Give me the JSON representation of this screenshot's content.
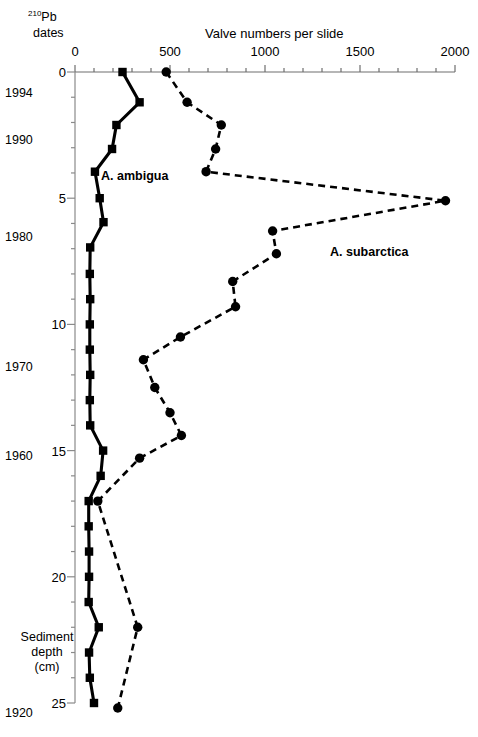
{
  "figure": {
    "left_header_line1_sup": "210",
    "left_header_line1": "Pb",
    "left_header_line2": "dates",
    "axis_title": "Valve numbers per slide",
    "depth_caption_line1": "Sediment",
    "depth_caption_line2": "depth",
    "depth_caption_line3": "(cm)"
  },
  "chart_data": {
    "type": "line",
    "title": "Valve numbers per slide",
    "xlabel": "Valve numbers per slide",
    "ylabel": "Sediment depth (cm)",
    "xlim": [
      0,
      2000
    ],
    "ylim": [
      0,
      25
    ],
    "y_inverted": true,
    "grid": false,
    "legend": "inline-annotations",
    "x_ticks": [
      0,
      500,
      1000,
      1500,
      2000
    ],
    "x_tick_labels": [
      "0",
      "500",
      "1000",
      "1500",
      "2000"
    ],
    "x_minor_tick_step": 100,
    "y_ticks": [
      0,
      5,
      10,
      15,
      20,
      25
    ],
    "y_tick_labels": [
      "0",
      "5",
      "10",
      "15",
      "20",
      "25"
    ],
    "y_minor_tick_step": 1,
    "secondary_axis": {
      "name": "210-Pb dates",
      "entries": [
        {
          "label": "1994",
          "depth": 0.85
        },
        {
          "label": "1990",
          "depth": 2.7
        },
        {
          "label": "1980",
          "depth": 6.55
        },
        {
          "label": "1970",
          "depth": 11.7
        },
        {
          "label": "1960",
          "depth": 15.2
        },
        {
          "label": "1920",
          "depth": 25.4
        }
      ]
    },
    "series": [
      {
        "name": "A. ambigua",
        "linestyle": "solid",
        "marker": "square",
        "color": "#000000",
        "points": [
          {
            "depth": 0.0,
            "value": 250
          },
          {
            "depth": 1.2,
            "value": 340
          },
          {
            "depth": 2.1,
            "value": 218
          },
          {
            "depth": 3.05,
            "value": 195
          },
          {
            "depth": 3.95,
            "value": 105
          },
          {
            "depth": 5.0,
            "value": 130
          },
          {
            "depth": 5.95,
            "value": 150
          },
          {
            "depth": 6.95,
            "value": 80
          },
          {
            "depth": 8.0,
            "value": 78
          },
          {
            "depth": 9.0,
            "value": 80
          },
          {
            "depth": 10.0,
            "value": 78
          },
          {
            "depth": 11.0,
            "value": 78
          },
          {
            "depth": 12.0,
            "value": 80
          },
          {
            "depth": 13.0,
            "value": 78
          },
          {
            "depth": 14.0,
            "value": 80
          },
          {
            "depth": 15.0,
            "value": 148
          },
          {
            "depth": 16.0,
            "value": 135
          },
          {
            "depth": 17.0,
            "value": 72
          },
          {
            "depth": 18.0,
            "value": 72
          },
          {
            "depth": 19.0,
            "value": 74
          },
          {
            "depth": 20.0,
            "value": 74
          },
          {
            "depth": 21.0,
            "value": 72
          },
          {
            "depth": 22.0,
            "value": 125
          },
          {
            "depth": 23.0,
            "value": 74
          },
          {
            "depth": 24.0,
            "value": 78
          },
          {
            "depth": 25.0,
            "value": 100
          }
        ]
      },
      {
        "name": "A. subarctica",
        "linestyle": "dashed",
        "marker": "circle",
        "color": "#000000",
        "points": [
          {
            "depth": 0.0,
            "value": 480
          },
          {
            "depth": 1.2,
            "value": 590
          },
          {
            "depth": 2.1,
            "value": 770
          },
          {
            "depth": 3.05,
            "value": 740
          },
          {
            "depth": 3.95,
            "value": 690
          },
          {
            "depth": 5.1,
            "value": 1950
          },
          {
            "depth": 6.3,
            "value": 1040
          },
          {
            "depth": 7.2,
            "value": 1060
          },
          {
            "depth": 8.3,
            "value": 830
          },
          {
            "depth": 9.3,
            "value": 845
          },
          {
            "depth": 10.5,
            "value": 555
          },
          {
            "depth": 11.4,
            "value": 360
          },
          {
            "depth": 12.5,
            "value": 420
          },
          {
            "depth": 13.5,
            "value": 500
          },
          {
            "depth": 14.4,
            "value": 560
          },
          {
            "depth": 15.3,
            "value": 340
          },
          {
            "depth": 17.0,
            "value": 120
          },
          {
            "depth": 22.0,
            "value": 330
          },
          {
            "depth": 25.2,
            "value": 225
          }
        ]
      }
    ],
    "annotations": [
      {
        "text": "A. ambigua",
        "x_px": 101,
        "y_px": 170
      },
      {
        "text": "A. subarctica",
        "x_px": 330,
        "y_px": 246
      }
    ]
  }
}
